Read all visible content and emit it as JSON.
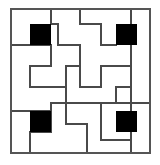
{
  "figure": {
    "caption": "",
    "background_color": "#ffffff",
    "line_color": "#4a4a4a",
    "border_color": "#555555",
    "fill_color": "#000000",
    "canvas": {
      "width": 160,
      "height": 165
    }
  },
  "grid": {
    "origin_x": 11,
    "origin_y": 9,
    "cell_size": 20,
    "columns": 7,
    "rows": 7,
    "width": 140,
    "height": 145,
    "stroke_width": 1.6,
    "border_stroke_width": 1.8
  },
  "border": {
    "name": "outer-border",
    "x": 11,
    "y": 9,
    "width": 139,
    "height": 144
  },
  "filled_cells": [
    {
      "name": "filled-cell-top-left",
      "col": 1,
      "row": 1,
      "x": 30,
      "y": 24,
      "size": 21
    },
    {
      "name": "filled-cell-top-right",
      "col": 5,
      "row": 1,
      "x": 116,
      "y": 24,
      "size": 21
    },
    {
      "name": "filled-cell-bottom-left",
      "col": 1,
      "row": 5,
      "x": 30,
      "y": 111,
      "size": 21
    },
    {
      "name": "filled-cell-bottom-right",
      "col": 5,
      "row": 5,
      "x": 116,
      "y": 111,
      "size": 21
    }
  ],
  "wall_segments": [
    {
      "name": "wall-h-1",
      "orient": "h",
      "x1": 80,
      "y1": 9,
      "x2": 80,
      "y2": 24
    },
    {
      "name": "wall-h-2",
      "orient": "h",
      "x1": 80,
      "y1": 24,
      "x2": 101,
      "y2": 24
    },
    {
      "name": "wall-h-3",
      "orient": "v",
      "x1": 101,
      "y1": 24,
      "x2": 101,
      "y2": 45
    },
    {
      "name": "wall-h-4",
      "orient": "h",
      "x1": 101,
      "y1": 45,
      "x2": 116,
      "y2": 45
    },
    {
      "name": "wall-h-5",
      "orient": "v",
      "x1": 131,
      "y1": 9,
      "x2": 131,
      "y2": 153
    },
    {
      "name": "wall-h-6",
      "orient": "h",
      "x1": 11,
      "y1": 45,
      "x2": 30,
      "y2": 45
    },
    {
      "name": "wall-h-7",
      "orient": "h",
      "x1": 51,
      "y1": 24,
      "x2": 58,
      "y2": 24
    },
    {
      "name": "wall-h-8",
      "orient": "v",
      "x1": 58,
      "y1": 24,
      "x2": 58,
      "y2": 45
    },
    {
      "name": "wall-h-9",
      "orient": "h",
      "x1": 58,
      "y1": 45,
      "x2": 80,
      "y2": 45
    },
    {
      "name": "wall-h-10",
      "orient": "v",
      "x1": 80,
      "y1": 45,
      "x2": 80,
      "y2": 66
    },
    {
      "name": "wall-h-11",
      "orient": "h",
      "x1": 30,
      "y1": 66,
      "x2": 51,
      "y2": 66
    },
    {
      "name": "wall-h-12",
      "orient": "v",
      "x1": 51,
      "y1": 45,
      "x2": 51,
      "y2": 66
    },
    {
      "name": "wall-h-13",
      "orient": "v",
      "x1": 30,
      "y1": 66,
      "x2": 30,
      "y2": 87
    },
    {
      "name": "wall-h-14",
      "orient": "h",
      "x1": 30,
      "y1": 87,
      "x2": 66,
      "y2": 87
    },
    {
      "name": "wall-h-15",
      "orient": "v",
      "x1": 66,
      "y1": 66,
      "x2": 66,
      "y2": 103
    },
    {
      "name": "wall-h-16",
      "orient": "h",
      "x1": 66,
      "y1": 66,
      "x2": 80,
      "y2": 66
    },
    {
      "name": "wall-h-17",
      "orient": "h",
      "x1": 80,
      "y1": 87,
      "x2": 101,
      "y2": 87
    },
    {
      "name": "wall-h-18",
      "orient": "v",
      "x1": 80,
      "y1": 66,
      "x2": 80,
      "y2": 87
    },
    {
      "name": "wall-h-19",
      "orient": "h",
      "x1": 101,
      "y1": 66,
      "x2": 131,
      "y2": 66
    },
    {
      "name": "wall-h-20",
      "orient": "v",
      "x1": 101,
      "y1": 66,
      "x2": 101,
      "y2": 87
    },
    {
      "name": "wall-h-21",
      "orient": "h",
      "x1": 51,
      "y1": 103,
      "x2": 150,
      "y2": 103
    },
    {
      "name": "wall-h-22",
      "orient": "v",
      "x1": 51,
      "y1": 103,
      "x2": 51,
      "y2": 111
    },
    {
      "name": "wall-h-23",
      "orient": "h",
      "x1": 11,
      "y1": 111,
      "x2": 51,
      "y2": 111
    },
    {
      "name": "wall-h-24",
      "orient": "v",
      "x1": 51,
      "y1": 111,
      "x2": 51,
      "y2": 132
    },
    {
      "name": "wall-h-25",
      "orient": "h",
      "x1": 30,
      "y1": 132,
      "x2": 51,
      "y2": 132
    },
    {
      "name": "wall-h-26",
      "orient": "v",
      "x1": 30,
      "y1": 132,
      "x2": 30,
      "y2": 153
    },
    {
      "name": "wall-h-27",
      "orient": "v",
      "x1": 66,
      "y1": 103,
      "x2": 66,
      "y2": 124
    },
    {
      "name": "wall-h-28",
      "orient": "h",
      "x1": 66,
      "y1": 124,
      "x2": 87,
      "y2": 124
    },
    {
      "name": "wall-h-29",
      "orient": "v",
      "x1": 87,
      "y1": 124,
      "x2": 87,
      "y2": 153
    },
    {
      "name": "wall-h-30",
      "orient": "v",
      "x1": 101,
      "y1": 103,
      "x2": 101,
      "y2": 140
    },
    {
      "name": "wall-h-31",
      "orient": "h",
      "x1": 101,
      "y1": 140,
      "x2": 131,
      "y2": 140
    },
    {
      "name": "wall-h-32",
      "orient": "v",
      "x1": 116,
      "y1": 87,
      "x2": 116,
      "y2": 103
    },
    {
      "name": "wall-h-33",
      "orient": "h",
      "x1": 116,
      "y1": 87,
      "x2": 131,
      "y2": 87
    },
    {
      "name": "wall-h-34",
      "orient": "v",
      "x1": 11,
      "y1": 66,
      "x2": 11,
      "y2": 66
    },
    {
      "name": "wall-h-35",
      "orient": "h",
      "x1": 30,
      "y1": 45,
      "x2": 51,
      "y2": 45
    },
    {
      "name": "wall-h-36",
      "orient": "v",
      "x1": 51,
      "y1": 9,
      "x2": 51,
      "y2": 24
    }
  ]
}
